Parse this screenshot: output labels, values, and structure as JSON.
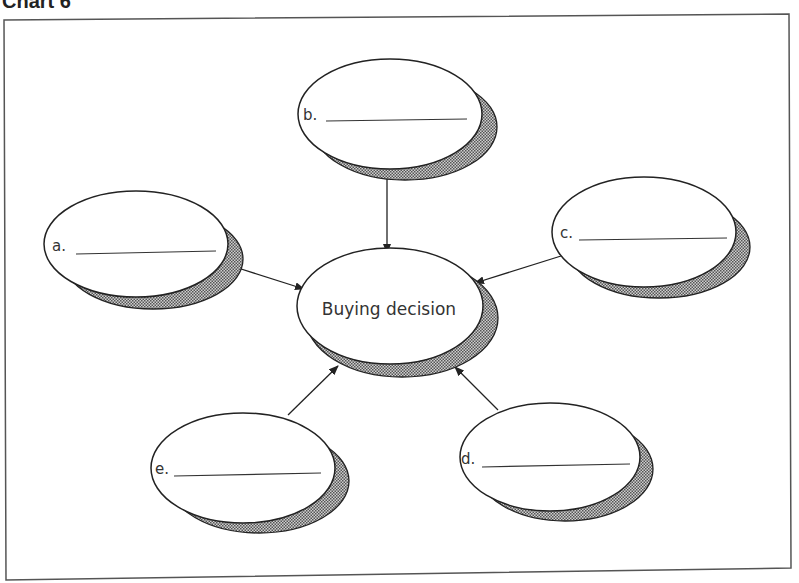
{
  "heading": "Chart 6",
  "center": {
    "label": "Buying decision"
  },
  "nodes": [
    {
      "id": "a",
      "label": "a."
    },
    {
      "id": "b",
      "label": "b."
    },
    {
      "id": "c",
      "label": "c."
    },
    {
      "id": "d",
      "label": "d."
    },
    {
      "id": "e",
      "label": "e."
    }
  ],
  "colors": {
    "stroke": "#222222",
    "fill": "#ffffff",
    "shadow": "#8a8a8a",
    "frame": "#555555"
  }
}
